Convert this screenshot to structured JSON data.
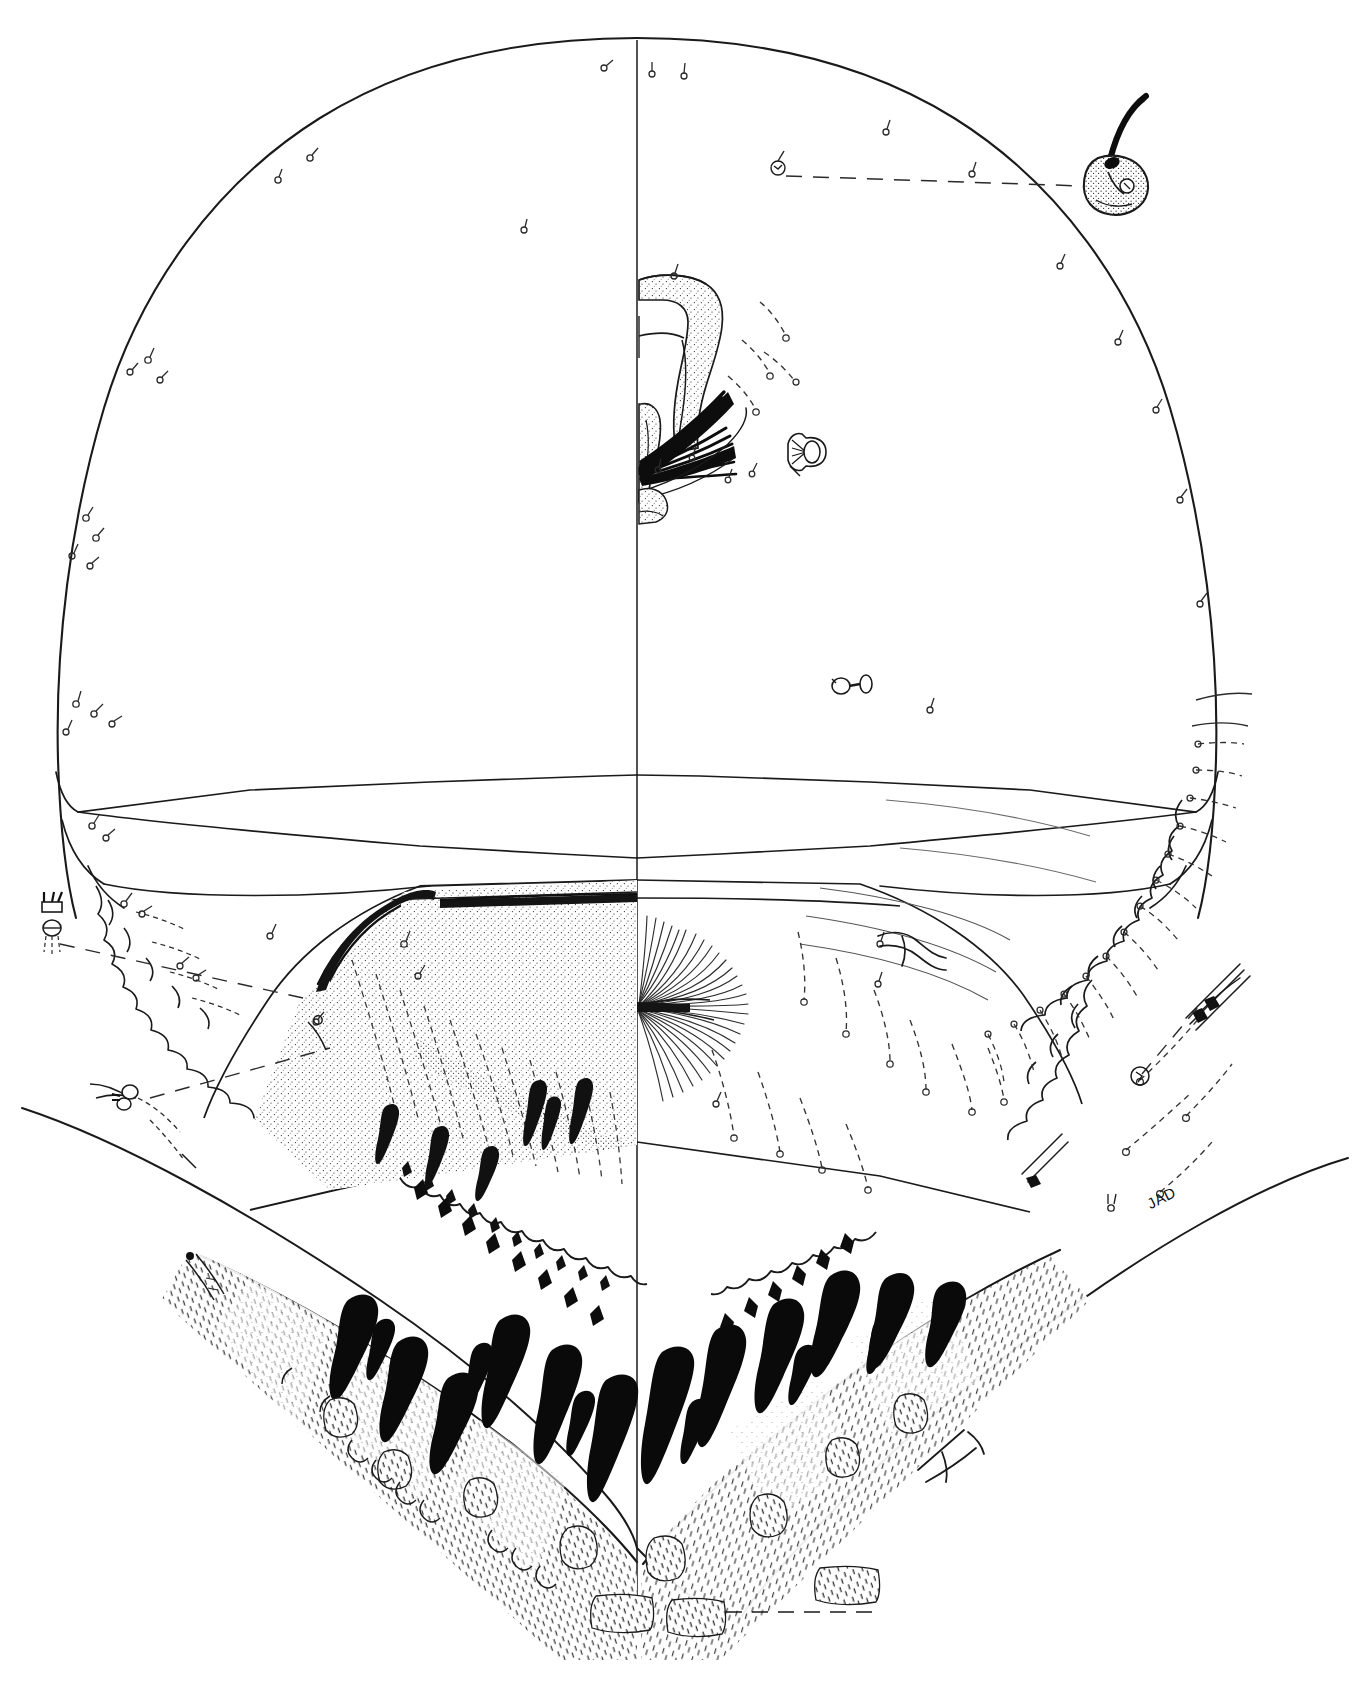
{
  "figure": {
    "domain": "scientific-illustration",
    "orientation": "ventral",
    "rendering_style": "stipple-and-line pen-and-ink",
    "background_color": "#ffffff",
    "ink_color": "#1a1a1a",
    "stipple_color": "#2b2b2b",
    "dash_color": "#3a3a3a",
    "canvas": {
      "width": 1372,
      "height": 1692
    }
  },
  "signature": {
    "text": "JAD",
    "x": 1148,
    "y": 1196,
    "rotation_deg": -27
  },
  "midline": {
    "name": "sagittal-midline",
    "x": 637,
    "y_top": 40,
    "y_bottom": 1630,
    "note": "vertical division separating left external half from right internal half"
  },
  "halves": [
    {
      "side": "left",
      "label": "external surface half",
      "content": "smooth cuticle outline, stippled labral plate, marginal crenulations, socketed alveoli"
    },
    {
      "side": "right",
      "label": "internal structure half",
      "content": "radiating setal fan, dashed setal tracks, sensilla, enlarged detail callouts"
    }
  ],
  "structures": [
    {
      "name": "head-capsule-outline",
      "label": "head capsule outline",
      "region": "whole"
    },
    {
      "name": "frontoclypeal-apotome",
      "label": "frontoclypeal apotome",
      "region": "dorsal-center"
    },
    {
      "name": "labral-plate",
      "label": "labral plate",
      "region": "mid-center"
    },
    {
      "name": "epipharyngeal-brush",
      "label": "epipharyngeal brush",
      "region": "mid-center"
    },
    {
      "name": "premandible",
      "label": "premandible",
      "region": "center"
    },
    {
      "name": "mentum-plate",
      "label": "mentum plate",
      "region": "lower-center"
    },
    {
      "name": "ventromental-plate",
      "label": "ventromental plate",
      "region": "lower-center"
    },
    {
      "name": "ventromental-setal-fan",
      "label": "ventromental setal fan",
      "region": "lower-center-right"
    },
    {
      "name": "lateral-crenulate-margin",
      "label": "lateral crenulate margin",
      "region": "lateral"
    },
    {
      "name": "spatulate-seta-row",
      "label": "row of spatulate setae",
      "region": "ventral-margin"
    },
    {
      "name": "occipital-margin",
      "label": "occipital margin",
      "region": "ventral"
    }
  ],
  "callouts": [
    {
      "id": "callout-upper-right",
      "name": "enlarged-sensillum-upper-right",
      "label": "enlarged basiconic sensillum with long trichoid shaft",
      "source": {
        "x": 776,
        "y": 170
      },
      "target": {
        "x": 1110,
        "y": 180
      },
      "leader": "dashed"
    },
    {
      "id": "callout-left",
      "name": "enlarged-seta-left",
      "label": "enlarged bifid seta in socket",
      "source": {
        "x": 300,
        "y": 1010
      },
      "target": {
        "x": 52,
        "y": 915
      },
      "leader": "dashed"
    },
    {
      "id": "callout-lower-left",
      "name": "enlarged-seta-lower-left",
      "label": "enlarged compound seta cluster",
      "source": {
        "x": 260,
        "y": 1040
      },
      "target": {
        "x": 122,
        "y": 1098
      },
      "leader": "dashed"
    },
    {
      "id": "callout-lower-right",
      "name": "enlarged-seta-lower-right",
      "label": "enlarged slender seta bundle",
      "source": {
        "x": 1140,
        "y": 1072
      },
      "target": {
        "x": 1215,
        "y": 985
      },
      "leader": "dashed"
    }
  ],
  "detail_insets": [
    {
      "name": "palmate-seta-inset",
      "label": "palmate (fan) seta",
      "x": 800,
      "y": 452
    },
    {
      "name": "dumbbell-seta-inset",
      "label": "dumbbell seta",
      "x": 851,
      "y": 686
    },
    {
      "name": "forked-seta-inset",
      "label": "forked seta",
      "x": 908,
      "y": 940
    },
    {
      "name": "bifid-seta-inset",
      "label": "bifid seta in socket",
      "x": 52,
      "y": 915
    }
  ],
  "seta_types": [
    {
      "name": "alveolus-with-short-seta",
      "count_note": "scattered over capsule",
      "symbol": "socket + hook"
    },
    {
      "name": "trichoid-seta",
      "count_note": "lateral margins",
      "symbol": "long curved hair"
    },
    {
      "name": "spatulate-black-seta",
      "count_note": "ventral margin row",
      "symbol": "solid black club"
    },
    {
      "name": "dashed-track-seta",
      "count_note": "internal, right half",
      "symbol": "dashed line + ring"
    },
    {
      "name": "palmate-seta",
      "count_note": "isolated details",
      "symbol": "fan"
    }
  ],
  "scale": {
    "present": false,
    "bar_label": ""
  }
}
